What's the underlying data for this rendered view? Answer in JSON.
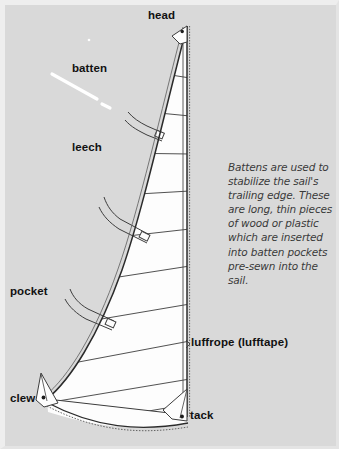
{
  "figure": {
    "background_color": "#d9d9d9",
    "sail_fill_color": "#fdfdfd",
    "line_color": "#2b2b2b",
    "caption_text_color": "#3a3a3a"
  },
  "labels": {
    "head": "head",
    "batten": "batten",
    "leech": "leech",
    "pocket": "pocket",
    "clew": "clew",
    "luffrope": "luffrope (lufftape)",
    "tack": "tack"
  },
  "caption": {
    "text": "Battens are used to stabilize the sail's trailing edge. These are long, thin pieces of wood or plastic which are inserted into batten pockets pre-sewn into the sail."
  },
  "parts": {
    "grommets": [
      "head-grommet",
      "tack-grommet",
      "clew-grommet"
    ],
    "batten_pockets_count": 3,
    "panel_seams_count": 11
  }
}
